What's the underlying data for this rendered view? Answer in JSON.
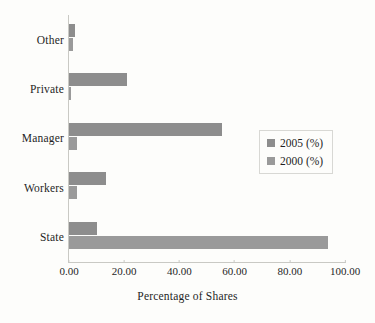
{
  "chart_data": {
    "type": "bar",
    "orientation": "horizontal",
    "title": "",
    "xlabel": "Percentage of Shares",
    "ylabel": "",
    "xlim": [
      0,
      100
    ],
    "xticks": [
      "0.00",
      "20.00",
      "40.00",
      "60.00",
      "80.00",
      "100.00"
    ],
    "xtick_values": [
      0,
      20,
      40,
      60,
      80,
      100
    ],
    "grid": false,
    "legend_position": "center-right",
    "categories": [
      "Other",
      "Private",
      "Manager",
      "Workers",
      "State"
    ],
    "series": [
      {
        "name": "2005 (%)",
        "color": "#8d8d8d",
        "values": [
          2.0,
          21.0,
          55.5,
          13.5,
          10.0
        ]
      },
      {
        "name": "2000 (%)",
        "color": "#9a9a9a",
        "values": [
          1.5,
          0.5,
          3.0,
          3.0,
          94.0
        ]
      }
    ]
  },
  "axis": {
    "x_title": "Percentage of Shares"
  },
  "legend": {
    "items": [
      {
        "label": "2005 (%)"
      },
      {
        "label": "2000 (%)"
      }
    ]
  }
}
